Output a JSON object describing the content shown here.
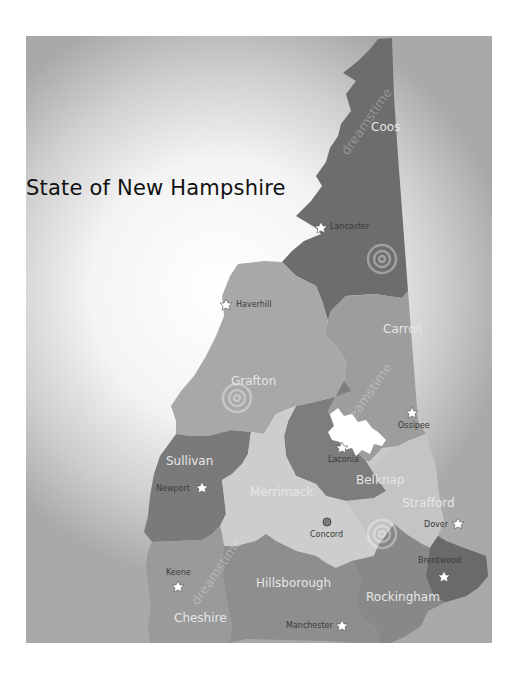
{
  "map": {
    "title": "State of New Hampshire",
    "watermark_text": "dreamstime",
    "colors": {
      "background_center": "#ffffff",
      "background_edge": "#a9a9a9",
      "coos": "#6d6d6d",
      "grafton": "#a8a8a8",
      "carroll": "#9d9d9d",
      "belknap": "#7d7d7d",
      "sullivan": "#7a7a7a",
      "merrimack": "#cdcdcd",
      "strafford": "#c4c4c4",
      "cheshire": "#9a9a9a",
      "hillsborough": "#8e8e8e",
      "rockingham": "#888888",
      "rockingham_east": "#6a6a6a",
      "lake": "#ffffff"
    },
    "counties": [
      {
        "name": "Coos"
      },
      {
        "name": "Grafton"
      },
      {
        "name": "Carroll"
      },
      {
        "name": "Belknap"
      },
      {
        "name": "Sullivan"
      },
      {
        "name": "Merrimack"
      },
      {
        "name": "Strafford"
      },
      {
        "name": "Cheshire"
      },
      {
        "name": "Hillsborough"
      },
      {
        "name": "Rockingham"
      }
    ],
    "cities": [
      {
        "name": "Lancaster",
        "marker": "star"
      },
      {
        "name": "Haverhill",
        "marker": "star"
      },
      {
        "name": "Ossipee",
        "marker": "star"
      },
      {
        "name": "Laconia",
        "marker": "star"
      },
      {
        "name": "Newport",
        "marker": "star"
      },
      {
        "name": "Concord",
        "marker": "capital"
      },
      {
        "name": "Dover",
        "marker": "star"
      },
      {
        "name": "Brentwood",
        "marker": "star"
      },
      {
        "name": "Keene",
        "marker": "star"
      },
      {
        "name": "Manchester",
        "marker": "star"
      }
    ]
  }
}
